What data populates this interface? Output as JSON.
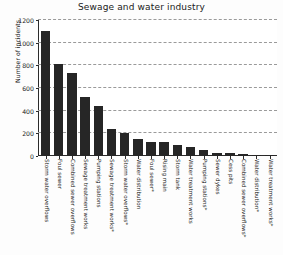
{
  "chart_data": {
    "type": "bar",
    "title": "Sewage and water industry",
    "xlabel": "",
    "ylabel": "Number of incidents",
    "ylim": [
      0,
      1200
    ],
    "yticks": [
      0,
      200,
      400,
      600,
      800,
      1000,
      1200
    ],
    "grid": true,
    "legend": null,
    "bar_color": "#262626",
    "background_color": "#ffffff",
    "categories": [
      "Storm water overflows",
      "Foul sewer",
      "Combined sewer overflows",
      "Sewage treatment works",
      "Pumping stations",
      "Sewage treatment works*",
      "Storm water overflows*",
      "Water distribution",
      "Foul sewer*",
      "Rising main",
      "Storm tank",
      "Water treatment works",
      "Pumping stations*",
      "Sewer dykes",
      "Cess pits",
      "Combined sewer overflows*",
      "Water distribution*",
      "Water treatment works*"
    ],
    "values": [
      1100,
      815,
      735,
      520,
      440,
      235,
      207,
      152,
      122,
      120,
      93,
      80,
      52,
      30,
      28,
      20,
      13,
      8
    ]
  }
}
